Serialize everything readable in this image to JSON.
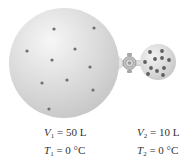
{
  "diagram": {
    "colors": {
      "flask_fill": "#d6d6d6",
      "flask_highlight": "#f4f4f4",
      "molecule": "#6e6e6e",
      "valve": "#bdbdbd"
    },
    "flask_1": {
      "name": "large-flask",
      "volume_symbol": "V",
      "volume_subscript": "1",
      "volume_value": "= 50 L",
      "temperature_symbol": "T",
      "temperature_subscript": "1",
      "temperature_value": "= 0 °C",
      "molecule_count": 10
    },
    "flask_2": {
      "name": "small-flask",
      "volume_symbol": "V",
      "volume_subscript": "2",
      "volume_value": "= 10 L",
      "temperature_symbol": "T",
      "temperature_subscript": "2",
      "temperature_value": "= 0 °C",
      "molecule_count": 11
    },
    "valve": {
      "state": "closed",
      "icon": "stopcock-valve-icon"
    }
  }
}
